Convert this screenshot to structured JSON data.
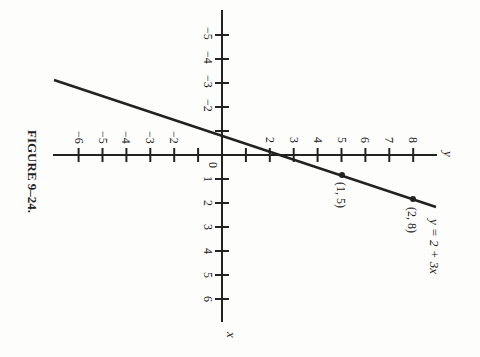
{
  "caption": "FIGURE 9–24.",
  "colors": {
    "ink": "#222222",
    "paper": "#fdfdfb"
  },
  "chart_data": {
    "type": "line",
    "title": "FIGURE 9–24.",
    "orientation_note": "figure rotated 90° clockwise on page",
    "xlabel": "x",
    "ylabel": "y",
    "x_ticks": [
      1,
      2,
      3,
      4,
      5,
      6
    ],
    "y_ticks": [
      -6,
      -5,
      -4,
      -3,
      -2,
      2,
      3,
      4,
      5,
      6,
      7,
      8
    ],
    "y_ticks_negative_upper": [
      -5,
      -4,
      -3,
      -2
    ],
    "origin_label": "0",
    "xlim": [
      -5.9,
      7
    ],
    "ylim": [
      -7,
      9
    ],
    "grid": false,
    "series": [
      {
        "name": "y = 2 + 3x",
        "equation": "y = 2 + 3x",
        "x": [
          -2.8,
          0,
          1,
          2,
          2.3
        ],
        "y": [
          -6.4,
          2,
          5,
          8,
          8.9
        ]
      }
    ],
    "points": [
      {
        "x": 1,
        "y": 5,
        "label": "(1, 5)"
      },
      {
        "x": 2,
        "y": 8,
        "label": "(2, 8)"
      }
    ],
    "annotations": [
      "y = 2 + 3x",
      "(1, 5)",
      "(2, 8)"
    ]
  },
  "labels": {
    "origin": "0",
    "x_axis": "x",
    "y_axis": "y",
    "equation": "y = 2 + 3x",
    "p1": "(1, 5)",
    "p2": "(2, 8)",
    "xticks": [
      "1",
      "2",
      "3",
      "4",
      "5",
      "6"
    ],
    "xticks_neg": [
      "−5",
      "−4",
      "−3",
      "−2"
    ],
    "yticks_neg": [
      "−6",
      "−5",
      "−4",
      "−3",
      "−2"
    ],
    "yticks_pos": [
      "2",
      "3",
      "4",
      "5",
      "6",
      "7",
      "8"
    ]
  }
}
